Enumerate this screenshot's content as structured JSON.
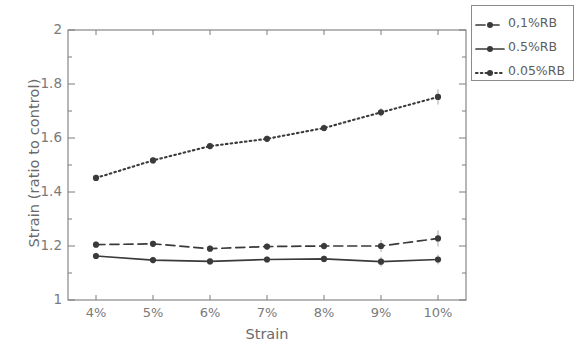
{
  "chart_data": {
    "type": "line",
    "title": "",
    "xlabel": "Strain",
    "ylabel": "Strain (ratio to control)",
    "categories": [
      "4%",
      "5%",
      "6%",
      "7%",
      "8%",
      "9%",
      "10%"
    ],
    "ylim": [
      1,
      2
    ],
    "ytick_labels": [
      "2",
      "1.8",
      "1.6",
      "1.4",
      "1.2",
      "1"
    ],
    "ytick_values": [
      2,
      1.8,
      1.6,
      1.4,
      1.2,
      1
    ],
    "yminor_step": 0.1,
    "grid": false,
    "legend_position": "top-right-outside",
    "series": [
      {
        "name": "0,1%RB",
        "style": "dashed",
        "marker": "circle",
        "color": "#3a3a3a",
        "values": [
          1.205,
          1.208,
          1.19,
          1.198,
          1.2,
          1.2,
          1.228
        ],
        "errors": [
          0.012,
          0.012,
          0.012,
          0.012,
          0.014,
          0.022,
          0.03
        ]
      },
      {
        "name": "0.5%RB",
        "style": "solid",
        "marker": "circle",
        "color": "#3a3a3a",
        "values": [
          1.163,
          1.148,
          1.143,
          1.15,
          1.152,
          1.142,
          1.15
        ],
        "errors": [
          0.012,
          0.012,
          0.012,
          0.012,
          0.013,
          0.018,
          0.018
        ]
      },
      {
        "name": "0.05%RB",
        "style": "dotted",
        "marker": "circle",
        "color": "#3a3a3a",
        "values": [
          1.452,
          1.517,
          1.57,
          1.597,
          1.637,
          1.695,
          1.752
        ],
        "errors": [
          0.012,
          0.012,
          0.012,
          0.012,
          0.013,
          0.016,
          0.028
        ]
      }
    ]
  },
  "legend": {
    "items": [
      {
        "label": "0,1%RB",
        "style": "dashed"
      },
      {
        "label": "0.5%RB",
        "style": "solid"
      },
      {
        "label": "0.05%RB",
        "style": "dotted"
      }
    ]
  },
  "axes": {
    "x_title": "Strain",
    "y_title": "Strain (ratio to control)"
  }
}
